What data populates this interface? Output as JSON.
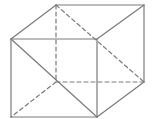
{
  "diagram": {
    "type": "cube-perspective",
    "stroke_color": "#7a7a7a",
    "background": "#ffffff",
    "stroke_width": 1.2,
    "dash_pattern": "4,3",
    "vertices": {
      "A": [
        11,
        39
      ],
      "B": [
        97,
        39
      ],
      "C": [
        97,
        117
      ],
      "D": [
        11,
        117
      ],
      "E": [
        56,
        5
      ],
      "F": [
        144,
        5
      ],
      "G": [
        144,
        82
      ],
      "H": [
        56,
        82
      ]
    },
    "solid_edges": [
      [
        "A",
        "B"
      ],
      [
        "B",
        "C"
      ],
      [
        "C",
        "D"
      ],
      [
        "D",
        "A"
      ],
      [
        "E",
        "F"
      ],
      [
        "F",
        "G"
      ],
      [
        "A",
        "E"
      ],
      [
        "B",
        "F"
      ],
      [
        "C",
        "G"
      ],
      [
        "A",
        "C"
      ]
    ],
    "dashed_edges": [
      [
        "E",
        "H"
      ],
      [
        "H",
        "G"
      ],
      [
        "H",
        "D"
      ],
      [
        "E",
        "G"
      ]
    ]
  }
}
